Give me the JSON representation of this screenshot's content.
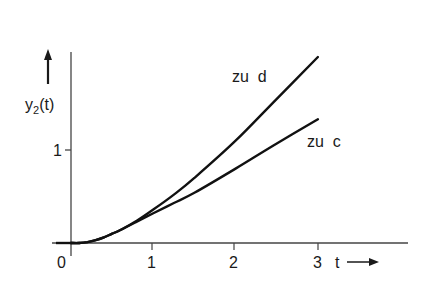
{
  "chart_data": {
    "type": "line",
    "title": "",
    "xlabel": "t",
    "ylabel": "y2(t)",
    "xlim": [
      -0.15,
      3.1
    ],
    "ylim": [
      0,
      2.1
    ],
    "grid": false,
    "legend": "inline labels",
    "x_ticks": [
      "0",
      "1",
      "2",
      "3"
    ],
    "y_ticks": [
      "1"
    ],
    "series": [
      {
        "name": "zu d",
        "x": [
          0,
          0.1,
          0.2,
          0.3,
          0.4,
          0.5,
          0.6,
          0.8,
          1.0,
          1.25,
          1.5,
          2.0,
          2.5,
          3.0
        ],
        "values": [
          0,
          0.0,
          0.01,
          0.03,
          0.06,
          0.1,
          0.14,
          0.24,
          0.36,
          0.52,
          0.7,
          1.1,
          1.55,
          2.0
        ]
      },
      {
        "name": "zu c",
        "x": [
          0,
          0.1,
          0.2,
          0.3,
          0.4,
          0.5,
          0.6,
          0.8,
          1.0,
          1.25,
          1.5,
          2.0,
          2.5,
          3.0
        ],
        "values": [
          0,
          0.0,
          0.01,
          0.03,
          0.06,
          0.1,
          0.14,
          0.23,
          0.32,
          0.43,
          0.54,
          0.8,
          1.07,
          1.33
        ]
      }
    ]
  },
  "labels": {
    "y_axis": "y",
    "y_axis_sub": "2",
    "y_axis_arg": "(t)",
    "x_axis": "t",
    "tick_x_0": "0",
    "tick_x_1": "1",
    "tick_x_2": "2",
    "tick_x_3": "3",
    "tick_y_1": "1",
    "curve_d": "zu  d",
    "curve_c": "zu  c"
  }
}
